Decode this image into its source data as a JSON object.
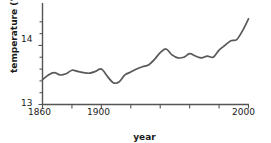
{
  "chart_data": {
    "type": "line",
    "title": "",
    "xlabel": "year",
    "ylabel": "temperature (°C)",
    "xlim": [
      1860,
      2000
    ],
    "ylim": [
      13,
      14.6
    ],
    "grid": false,
    "legend": "none",
    "line_color": "#595959",
    "axis_color": "#555555",
    "x_ticks_major": [
      1860,
      1900,
      2000
    ],
    "x_tick_labels": [
      "1860",
      "1900",
      "2000"
    ],
    "x_ticks_minor": [
      1880,
      1920,
      1940,
      1960,
      1980
    ],
    "y_ticks_major": [
      13,
      14
    ],
    "y_tick_labels": [
      "13",
      "14"
    ],
    "y_ticks_minor": [
      13.2,
      13.4,
      13.6,
      13.8,
      14.2,
      14.4
    ],
    "series": [
      {
        "name": "global mean temperature",
        "x": [
          1860,
          1864,
          1868,
          1872,
          1876,
          1880,
          1884,
          1888,
          1892,
          1896,
          1900,
          1904,
          1908,
          1912,
          1916,
          1920,
          1924,
          1928,
          1932,
          1936,
          1940,
          1944,
          1948,
          1952,
          1956,
          1960,
          1964,
          1968,
          1972,
          1976,
          1980,
          1984,
          1988,
          1992,
          1996,
          2000
        ],
        "values": [
          13.42,
          13.5,
          13.54,
          13.5,
          13.52,
          13.58,
          13.56,
          13.54,
          13.53,
          13.56,
          13.6,
          13.48,
          13.37,
          13.38,
          13.5,
          13.55,
          13.6,
          13.64,
          13.67,
          13.76,
          13.88,
          13.94,
          13.84,
          13.79,
          13.8,
          13.86,
          13.82,
          13.79,
          13.82,
          13.8,
          13.92,
          14.0,
          14.08,
          14.1,
          14.25,
          14.45
        ]
      }
    ]
  },
  "axes": {
    "y_label_text": "temperature (°C)",
    "x_label_text": "year",
    "x_tick_1860": "1860",
    "x_tick_1900": "1900",
    "x_tick_2000": "2000",
    "y_tick_13": "13",
    "y_tick_14": "14"
  }
}
